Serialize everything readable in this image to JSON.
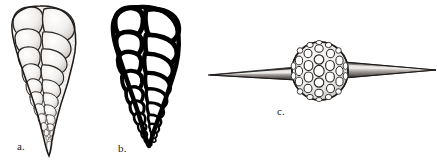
{
  "figure": {
    "kind": "scientific-plate",
    "background_color": "#ffffff",
    "ink_color": "#1a1a1a",
    "width": 437,
    "height": 163,
    "specimens": [
      {
        "id": "a",
        "label": "a.",
        "name": "biserial-foraminifer-shaded",
        "rendering": "stippled-shaded-halftone",
        "outline_color": "#1a1a1a",
        "fill_color": "#f2f0ee",
        "shape": "elongate-tapering-conical",
        "chamber_arrangement": "biserial",
        "chamber_rows": 11,
        "apex_position": "bottom",
        "widest_position": "top",
        "bounds": {
          "x": 4,
          "y": 6,
          "width": 74,
          "height": 150
        }
      },
      {
        "id": "b",
        "label": "b.",
        "name": "biserial-foraminifer-outline",
        "rendering": "thick-black-line-drawing",
        "outline_color": "#000000",
        "fill_color": "#ffffff",
        "shape": "elongate-tapering-conical",
        "chamber_arrangement": "biserial",
        "chamber_rows": 12,
        "apex_position": "bottom",
        "widest_position": "top",
        "bounds": {
          "x": 106,
          "y": 6,
          "width": 82,
          "height": 139
        }
      },
      {
        "id": "c",
        "label": "c.",
        "name": "spherical-spined-radiolarian",
        "rendering": "stippled-shaded-lattice",
        "outline_color": "#1a1a1a",
        "fill_color": "#ffffff",
        "shape": "sphere-with-two-opposed-polar-spines",
        "lattice": "hexagonal-pore-network",
        "pore_rings": 5,
        "spine_count": 2,
        "sphere": {
          "cx": 320,
          "cy": 71,
          "rx": 28,
          "ry": 29
        },
        "spine_left": {
          "tip_x": 208,
          "base_x": 294,
          "y": 74
        },
        "spine_right": {
          "tip_x": 436,
          "base_x": 346,
          "y": 70
        }
      }
    ]
  },
  "labels": {
    "a": "a.",
    "b": "b.",
    "c": "c."
  }
}
